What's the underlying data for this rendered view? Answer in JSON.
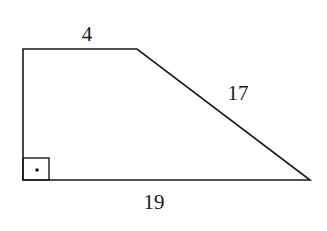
{
  "figure": {
    "shape": "right trapezoid",
    "labels": {
      "top": "4",
      "slant": "17",
      "bottom": "19"
    },
    "right_angle_marker": "square with dot",
    "stroke_color": "#1a1a1a",
    "background": "#ffffff"
  }
}
